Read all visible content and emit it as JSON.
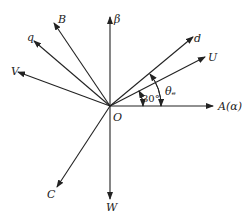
{
  "diagram": {
    "type": "phasor-vector-diagram",
    "origin": {
      "label": "O",
      "x": 110,
      "y": 106
    },
    "line_color": "#222222",
    "background": "#ffffff",
    "vectors": [
      {
        "id": "alpha",
        "label": "A(α)",
        "x2": 213,
        "y2": 106,
        "lx": 218,
        "ly": 110
      },
      {
        "id": "beta",
        "label": "β",
        "x2": 110,
        "y2": 17,
        "lx": 114,
        "ly": 23
      },
      {
        "id": "U",
        "label": "U",
        "x2": 205,
        "y2": 57,
        "lx": 208,
        "ly": 61
      },
      {
        "id": "d",
        "label": "d",
        "x2": 193,
        "y2": 37,
        "lx": 194,
        "ly": 42
      },
      {
        "id": "B",
        "label": "B",
        "x2": 54,
        "y2": 23,
        "lx": 58,
        "ly": 23
      },
      {
        "id": "q",
        "label": "q",
        "x2": 34,
        "y2": 41,
        "lx": 27,
        "ly": 41
      },
      {
        "id": "V",
        "label": "V",
        "x2": 18,
        "y2": 72,
        "lx": 11,
        "ly": 75
      },
      {
        "id": "C",
        "label": "C",
        "x2": 57,
        "y2": 187,
        "lx": 47,
        "ly": 198
      },
      {
        "id": "W",
        "label": "W",
        "x2": 110,
        "y2": 199,
        "lx": 106,
        "ly": 211
      }
    ],
    "angles": [
      {
        "id": "angle-30",
        "label": "30°",
        "lx": 143,
        "ly": 102
      },
      {
        "id": "angle-theta",
        "label": "θₑ",
        "lx": 165,
        "ly": 94
      }
    ]
  }
}
